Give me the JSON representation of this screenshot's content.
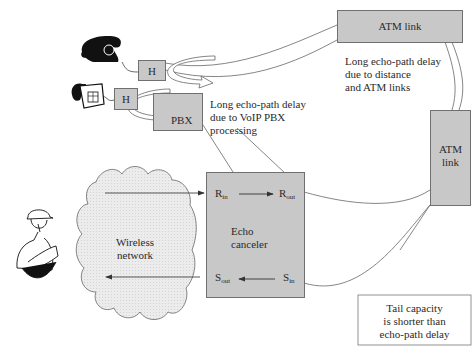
{
  "diagram": {
    "nodes": {
      "atm_link_top": {
        "label": "ATM link"
      },
      "atm_link_right": {
        "line1": "ATM",
        "line2": "link"
      },
      "hybrid_1": {
        "label": "H"
      },
      "hybrid_2": {
        "label": "H"
      },
      "pbx": {
        "label": "PBX"
      },
      "wireless_network": {
        "line1": "Wireless",
        "line2": "network"
      },
      "echo_canceler": {
        "line1": "Echo",
        "line2": "canceler"
      }
    },
    "ports": {
      "r_in": {
        "main": "R",
        "sub": "in"
      },
      "r_out": {
        "main": "R",
        "sub": "out"
      },
      "s_in": {
        "main": "S",
        "sub": "in"
      },
      "s_out": {
        "main": "S",
        "sub": "out"
      }
    },
    "annotations": {
      "atm_delay": {
        "line1": "Long echo-path delay",
        "line2": "due to distance",
        "line3": "and ATM links"
      },
      "pbx_delay": {
        "line1": "Long echo-path delay",
        "line2": "due to VoIP PBX",
        "line3": "processing"
      },
      "tail_capacity": {
        "line1": "Tail capacity",
        "line2": "is shorter than",
        "line3": "echo-path delay"
      }
    },
    "icons": [
      "rotary-telephone-icon",
      "desk-telephone-icon",
      "mobile-worker-icon"
    ],
    "colors": {
      "box_fill": "#c8c8c8",
      "box_border": "#707070",
      "cloud_fill": "#e6e6e6",
      "line": "#555555"
    }
  }
}
